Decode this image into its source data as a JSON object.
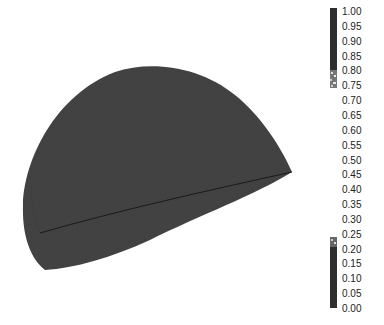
{
  "chart_data": {
    "type": "heatmap",
    "title": "",
    "xlabel": "",
    "ylabel": "",
    "surface_color": "#444444",
    "seam_color": "#1a1a1a",
    "colorbar": {
      "range": [
        0.0,
        1.0
      ],
      "ticks": [
        "1.00",
        "0.95",
        "0.90",
        "0.85",
        "0.80",
        "0.75",
        "0.70",
        "0.65",
        "0.60",
        "0.55",
        "0.50",
        "0.45",
        "0.40",
        "0.35",
        "0.30",
        "0.25",
        "0.20",
        "0.15",
        "0.10",
        "0.05",
        "0.00"
      ],
      "filled_segments": [
        {
          "from": 0.83,
          "to": 1.0,
          "color": "#333333"
        },
        {
          "from": 0.0,
          "to": 0.25,
          "color": "#333333"
        }
      ]
    },
    "grid": false,
    "legend": "none"
  }
}
